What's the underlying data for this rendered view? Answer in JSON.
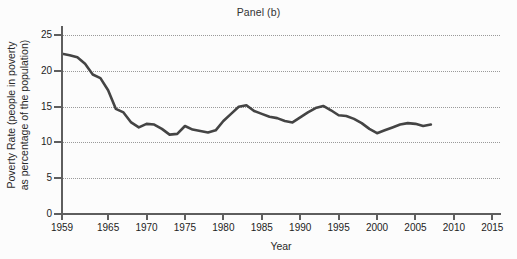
{
  "chart_data": {
    "type": "line",
    "title": "Panel (b)",
    "xlabel": "Year",
    "ylabel": "Poverty Rate (people in poverty\nas percentage of the population)",
    "xlim": [
      1959,
      2016
    ],
    "ylim": [
      0,
      26
    ],
    "xticks": [
      1959,
      1965,
      1970,
      1975,
      1980,
      1985,
      1990,
      1995,
      2000,
      2005,
      2010,
      2015
    ],
    "xtick_labels": [
      "1959",
      "1965",
      "1970",
      "1975",
      "1980",
      "1985",
      "1990",
      "1995",
      "2000",
      "2005",
      "2010",
      "2015"
    ],
    "yticks": [
      0,
      5,
      10,
      15,
      20,
      25
    ],
    "ytick_labels": [
      "0",
      "5",
      "10",
      "15",
      "20",
      "25"
    ],
    "grid": "horizontal-dotted",
    "legend": "none",
    "line_color": "#444444",
    "line_width": 2.6,
    "series": [
      {
        "name": "Poverty Rate",
        "x": [
          1959,
          1960,
          1961,
          1962,
          1963,
          1964,
          1965,
          1966,
          1967,
          1968,
          1969,
          1970,
          1971,
          1972,
          1973,
          1974,
          1975,
          1976,
          1977,
          1978,
          1979,
          1980,
          1981,
          1982,
          1983,
          1984,
          1985,
          1986,
          1987,
          1988,
          1989,
          1990,
          1991,
          1992,
          1993,
          1994,
          1995,
          1996,
          1997,
          1998,
          1999,
          2000,
          2001,
          2002,
          2003,
          2004,
          2005,
          2006,
          2007
        ],
        "values": [
          22.4,
          22.2,
          21.9,
          21.0,
          19.5,
          19.0,
          17.3,
          14.7,
          14.2,
          12.8,
          12.1,
          12.6,
          12.5,
          11.9,
          11.1,
          11.2,
          12.3,
          11.8,
          11.6,
          11.4,
          11.7,
          13.0,
          14.0,
          15.0,
          15.2,
          14.4,
          14.0,
          13.6,
          13.4,
          13.0,
          12.8,
          13.5,
          14.2,
          14.8,
          15.1,
          14.5,
          13.8,
          13.7,
          13.3,
          12.7,
          11.9,
          11.3,
          11.7,
          12.1,
          12.5,
          12.7,
          12.6,
          12.3,
          12.5
        ]
      }
    ]
  },
  "axis": {
    "title": "Panel (b)",
    "x_title": "Year",
    "y_title": "Poverty Rate (people in poverty\nas percentage of the population)"
  }
}
